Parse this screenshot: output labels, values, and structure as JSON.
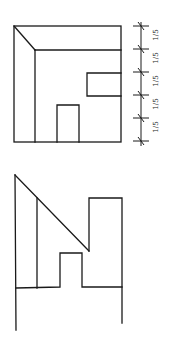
{
  "diagram": {
    "type": "orthographic-drawing",
    "top_view": {
      "dimension_labels": [
        "1/5",
        "1/5",
        "1/5",
        "1/5",
        "1/5"
      ],
      "dimension_numerator": "1",
      "dimension_denominator": "5",
      "divisions": 5
    },
    "bottom_view": {
      "description": "elevation with sloped roof, doorway notch and tall block"
    },
    "colors": {
      "line": "#1a1a1a",
      "background": "#ffffff"
    }
  }
}
